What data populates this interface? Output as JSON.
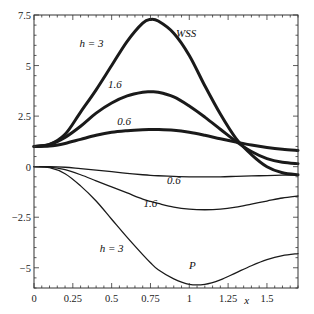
{
  "chart_data": {
    "type": "line",
    "title": "",
    "xlabel": "x",
    "ylabel": "",
    "xlim": [
      0,
      1.7
    ],
    "ylim": [
      -6,
      7.5
    ],
    "grid": false,
    "legend": "none",
    "x_ticks": [
      {
        "value": 0,
        "label": "0"
      },
      {
        "value": 0.25,
        "label": "0.25"
      },
      {
        "value": 0.5,
        "label": "0.5"
      },
      {
        "value": 0.75,
        "label": "0.75"
      },
      {
        "value": 1,
        "label": "1"
      },
      {
        "value": 1.25,
        "label": "1.25"
      },
      {
        "value": 1.5,
        "label": "1.5"
      }
    ],
    "y_ticks": [
      {
        "value": -5,
        "label": "−5"
      },
      {
        "value": -2.5,
        "label": "−2.5"
      },
      {
        "value": 0,
        "label": "0"
      },
      {
        "value": 2.5,
        "label": "2.5"
      },
      {
        "value": 5,
        "label": "5"
      },
      {
        "value": 7.5,
        "label": "7.5"
      }
    ],
    "x": [
      0,
      0.1,
      0.2,
      0.3,
      0.4,
      0.5,
      0.6,
      0.7,
      0.75,
      0.8,
      0.9,
      1.0,
      1.1,
      1.2,
      1.3,
      1.4,
      1.5,
      1.6,
      1.7
    ],
    "series": [
      {
        "name": "WSS h=3",
        "group": "WSS",
        "h": "3",
        "weight": "thick",
        "values": [
          1.0,
          1.1,
          1.6,
          2.7,
          3.8,
          5.0,
          6.2,
          7.1,
          7.28,
          7.2,
          6.6,
          5.5,
          4.0,
          2.6,
          1.4,
          0.6,
          0.0,
          -0.3,
          -0.4
        ]
      },
      {
        "name": "WSS h=1.6",
        "group": "WSS",
        "h": "1.6",
        "weight": "thick",
        "values": [
          1.0,
          1.1,
          1.45,
          2.0,
          2.65,
          3.15,
          3.5,
          3.68,
          3.7,
          3.68,
          3.45,
          3.0,
          2.45,
          1.85,
          1.25,
          0.75,
          0.4,
          0.22,
          0.15
        ]
      },
      {
        "name": "WSS h=0.6",
        "group": "WSS",
        "h": "0.6",
        "weight": "thick",
        "values": [
          1.0,
          1.02,
          1.15,
          1.35,
          1.55,
          1.7,
          1.78,
          1.83,
          1.84,
          1.84,
          1.8,
          1.7,
          1.55,
          1.38,
          1.22,
          1.07,
          0.95,
          0.86,
          0.8
        ]
      },
      {
        "name": "P h=0.6",
        "group": "P",
        "h": "0.6",
        "weight": "thin",
        "values": [
          0,
          0,
          -0.03,
          -0.1,
          -0.17,
          -0.25,
          -0.33,
          -0.4,
          -0.43,
          -0.45,
          -0.48,
          -0.5,
          -0.5,
          -0.5,
          -0.48,
          -0.46,
          -0.44,
          -0.42,
          -0.4
        ]
      },
      {
        "name": "P h=1.6",
        "group": "P",
        "h": "1.6",
        "weight": "thin",
        "values": [
          0,
          -0.02,
          -0.15,
          -0.4,
          -0.7,
          -1.0,
          -1.3,
          -1.6,
          -1.72,
          -1.82,
          -2.0,
          -2.1,
          -2.13,
          -2.1,
          -2.0,
          -1.85,
          -1.7,
          -1.55,
          -1.45
        ]
      },
      {
        "name": "P h=3",
        "group": "P",
        "h": "3",
        "weight": "thin",
        "values": [
          0,
          -0.05,
          -0.35,
          -0.95,
          -1.7,
          -2.6,
          -3.5,
          -4.35,
          -4.75,
          -5.1,
          -5.55,
          -5.82,
          -5.82,
          -5.6,
          -5.25,
          -4.9,
          -4.6,
          -4.4,
          -4.3
        ]
      }
    ],
    "annotations": [
      {
        "text": "h = 3",
        "x": 0.37,
        "y": 5.9,
        "target": "WSS h=3"
      },
      {
        "text": "WSS",
        "x": 0.98,
        "y": 6.4,
        "target": "WSS group"
      },
      {
        "text": "1.6",
        "x": 0.52,
        "y": 3.9,
        "target": "WSS h=1.6"
      },
      {
        "text": "0.6",
        "x": 0.58,
        "y": 2.05,
        "target": "WSS h=0.6"
      },
      {
        "text": "0.6",
        "x": 0.9,
        "y": -0.85,
        "target": "P h=0.6"
      },
      {
        "text": "1.6",
        "x": 0.75,
        "y": -2.0,
        "target": "P h=1.6"
      },
      {
        "text": "h = 3",
        "x": 0.5,
        "y": -4.2,
        "target": "P h=3"
      },
      {
        "text": "P",
        "x": 1.02,
        "y": -5.05,
        "target": "P group"
      }
    ]
  }
}
